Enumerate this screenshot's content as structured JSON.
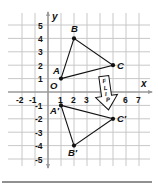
{
  "diagram": {
    "type": "coordinate-plane-reflection",
    "axes": {
      "x_label": "x",
      "y_label": "y",
      "x_ticks": [
        "-2",
        "-1",
        "1",
        "2",
        "3",
        "6",
        "7"
      ],
      "y_ticks": [
        "5",
        "4",
        "3",
        "2",
        "1",
        "-1",
        "-2",
        "-3",
        "-4",
        "-5"
      ],
      "x_range": [
        -2,
        7
      ],
      "y_range": [
        -5,
        5
      ],
      "origin_label": "O"
    },
    "original_triangle": {
      "points": [
        {
          "label": "A",
          "x": 1,
          "y": 1
        },
        {
          "label": "B",
          "x": 2,
          "y": 4
        },
        {
          "label": "C",
          "x": 5,
          "y": 2
        }
      ]
    },
    "image_triangle": {
      "points": [
        {
          "label": "A′",
          "x": 1,
          "y": -1
        },
        {
          "label": "B′",
          "x": 2,
          "y": -4
        },
        {
          "label": "C′",
          "x": 5,
          "y": -2
        }
      ]
    },
    "arrow": {
      "text": [
        "F",
        "L",
        "I",
        "P"
      ],
      "direction": "down"
    },
    "colors": {
      "grid": "#c8c8c8",
      "axis": "#9a9a9a",
      "ink": "#111111",
      "rule": "#222222"
    }
  }
}
